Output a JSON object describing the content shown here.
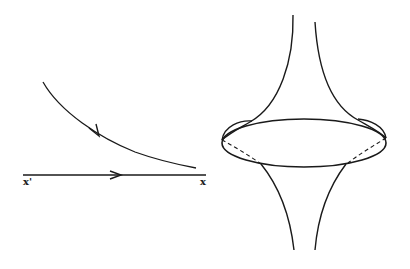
{
  "figure": {
    "left_panel": {
      "description": "Flow line approaching axis asymptotically",
      "labels": {
        "x_prime": "x'",
        "x": "x"
      }
    },
    "right_panel": {
      "description": "Surface of revolution with cusped profile and equatorial ellipse (dashed hidden portions)"
    },
    "colors": {
      "stroke": "#1a1a1a",
      "background": "#ffffff"
    }
  }
}
